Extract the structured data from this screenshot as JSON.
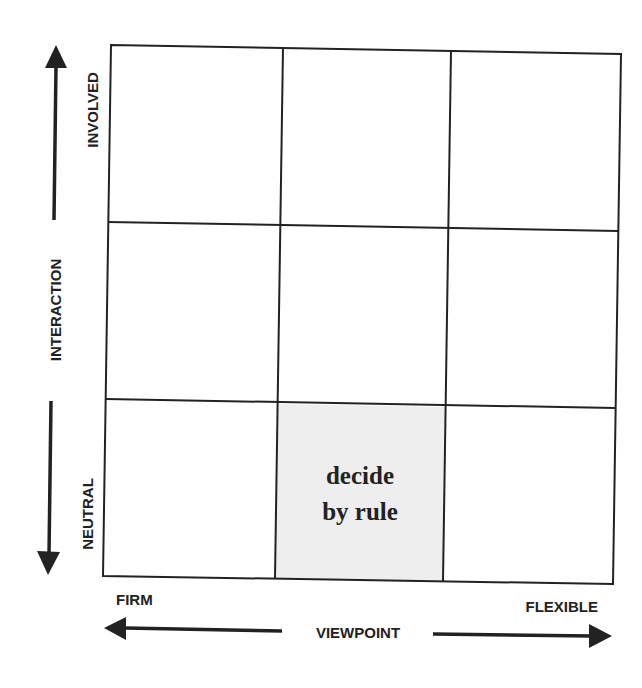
{
  "diagram": {
    "type": "3x3 matrix",
    "colors": {
      "line": "#222222",
      "highlight_fill": "#eeeeee",
      "background": "#ffffff"
    },
    "y_axis": {
      "title": "INTERACTION",
      "top_label": "INVOLVED",
      "bottom_label": "NEUTRAL",
      "arrows": [
        "up-arrow",
        "down-arrow"
      ]
    },
    "x_axis": {
      "title": "VIEWPOINT",
      "left_label": "FIRM",
      "right_label": "FLEXIBLE",
      "arrows": [
        "left-arrow",
        "right-arrow"
      ]
    },
    "grid": {
      "rows": 3,
      "columns": 3,
      "cells": [
        {
          "row": 1,
          "col": 1,
          "text": "",
          "highlighted": false
        },
        {
          "row": 1,
          "col": 2,
          "text": "",
          "highlighted": false
        },
        {
          "row": 1,
          "col": 3,
          "text": "",
          "highlighted": false
        },
        {
          "row": 2,
          "col": 1,
          "text": "",
          "highlighted": false
        },
        {
          "row": 2,
          "col": 2,
          "text": "",
          "highlighted": false
        },
        {
          "row": 2,
          "col": 3,
          "text": "",
          "highlighted": false
        },
        {
          "row": 3,
          "col": 1,
          "text": "",
          "highlighted": false
        },
        {
          "row": 3,
          "col": 2,
          "text": "decide by rule",
          "lines": [
            "decide",
            "by rule"
          ],
          "highlighted": true
        },
        {
          "row": 3,
          "col": 3,
          "text": "",
          "highlighted": false
        }
      ]
    }
  }
}
